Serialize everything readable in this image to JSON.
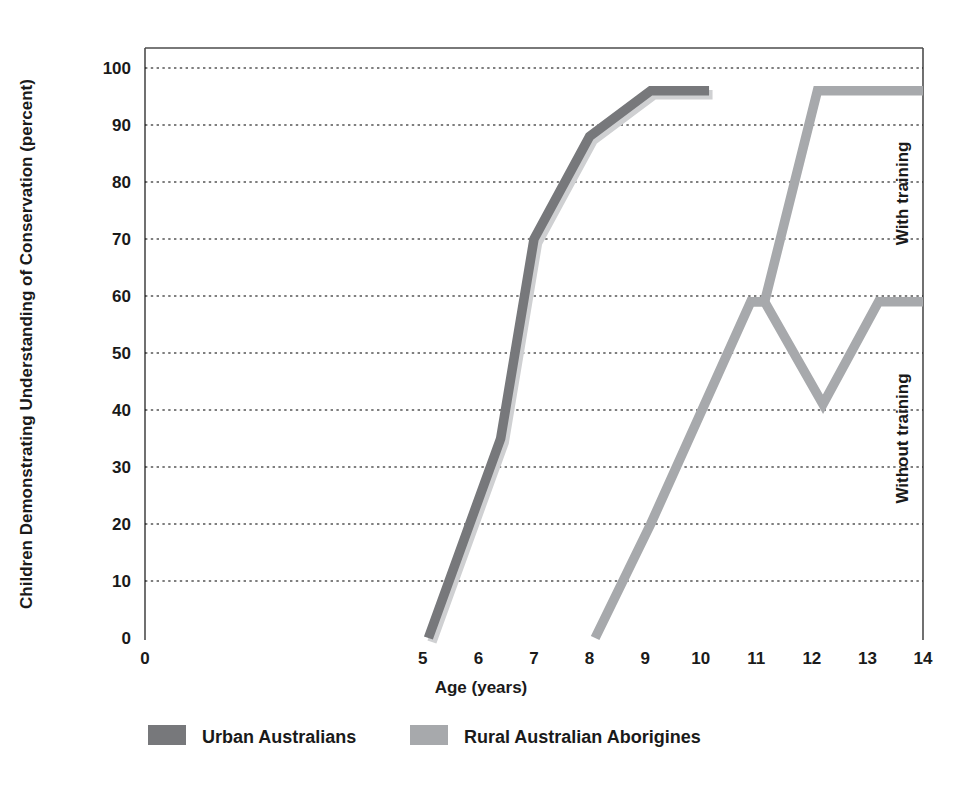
{
  "chart_data": {
    "type": "line",
    "title": "",
    "xlabel": "Age (years)",
    "ylabel": "Children Demonstrating Understanding of Conservation (percent)",
    "xlim": [
      0,
      14
    ],
    "ylim": [
      0,
      100
    ],
    "xticks": [
      "0",
      "5",
      "6",
      "7",
      "8",
      "9",
      "10",
      "11",
      "12",
      "13",
      "14"
    ],
    "xtick_values": [
      0,
      5,
      6,
      7,
      8,
      9,
      10,
      11,
      12,
      13,
      14
    ],
    "yticks": [
      "0",
      "10",
      "20",
      "30",
      "40",
      "50",
      "60",
      "70",
      "80",
      "90",
      "100"
    ],
    "ytick_values": [
      0,
      10,
      20,
      30,
      40,
      50,
      60,
      70,
      80,
      90,
      100
    ],
    "grid": "horizontal-dotted",
    "legend_position": "bottom",
    "series": [
      {
        "name": "Urban Australians",
        "color": "#77787b",
        "points": [
          [
            5.1,
            0
          ],
          [
            6.4,
            35
          ],
          [
            7.0,
            70
          ],
          [
            8.0,
            88
          ],
          [
            9.1,
            96
          ],
          [
            10.15,
            96
          ]
        ]
      },
      {
        "name": "Rural Australian Aborigines",
        "color": "#a7a9ac",
        "branch_label_with": "With training",
        "branch_label_without": "Without training",
        "points_common": [
          [
            8.1,
            0
          ],
          [
            9.1,
            20
          ],
          [
            10.9,
            59
          ]
        ],
        "points_with_training": [
          [
            10.9,
            59
          ],
          [
            11.15,
            59
          ],
          [
            12.1,
            96
          ],
          [
            14.0,
            96
          ]
        ],
        "points_without_training": [
          [
            10.9,
            59
          ],
          [
            11.15,
            59
          ],
          [
            12.2,
            41
          ],
          [
            13.2,
            59
          ],
          [
            14.0,
            59
          ]
        ]
      }
    ],
    "annotations": [
      {
        "text": "With training",
        "rotation": -90,
        "x": 14.05,
        "y": 78
      },
      {
        "text": "Without training",
        "rotation": -90,
        "x": 14.05,
        "y": 35
      }
    ]
  },
  "legend": {
    "items": [
      {
        "label": "Urban Australians",
        "color": "#77787b"
      },
      {
        "label": "Rural Australian Aborigines",
        "color": "#a7a9ac"
      }
    ]
  },
  "axes": {
    "x_title": "Age (years)",
    "y_title": "Children Demonstrating Understanding of Conservation (percent)"
  }
}
